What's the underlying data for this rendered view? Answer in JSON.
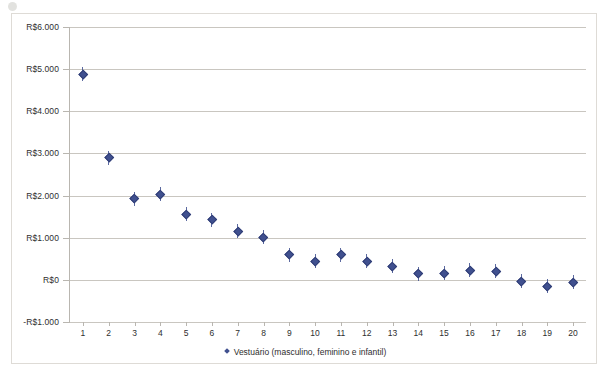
{
  "chart_data": {
    "type": "scatter",
    "title": "",
    "subtitle": "",
    "xlabel": "",
    "ylabel": "",
    "x": [
      1,
      2,
      3,
      4,
      5,
      6,
      7,
      8,
      9,
      10,
      11,
      12,
      13,
      14,
      15,
      16,
      17,
      18,
      19,
      20
    ],
    "values": [
      4880,
      2900,
      1930,
      2040,
      1570,
      1430,
      1150,
      1020,
      600,
      450,
      600,
      450,
      320,
      150,
      170,
      240,
      200,
      -20,
      -150,
      -50
    ],
    "series": [
      {
        "name": "Vestuário (masculino, feminino e infantil)",
        "values": [
          4880,
          2900,
          1930,
          2040,
          1570,
          1430,
          1150,
          1020,
          600,
          450,
          600,
          450,
          320,
          150,
          170,
          240,
          200,
          -20,
          -150,
          -50
        ]
      }
    ],
    "error_bars": true,
    "ylim": [
      -1000,
      6000
    ],
    "ytick_values": [
      6000,
      5000,
      4000,
      3000,
      2000,
      1000,
      0,
      -1000
    ],
    "ytick_labels": [
      "R$6.000",
      "R$5.000",
      "R$4.000",
      "R$3.000",
      "R$2.000",
      "R$1.000",
      "R$0",
      "-R$1.000"
    ],
    "xtick_labels": [
      "1",
      "2",
      "3",
      "4",
      "5",
      "6",
      "7",
      "8",
      "9",
      "10",
      "11",
      "12",
      "13",
      "14",
      "15",
      "16",
      "17",
      "18",
      "19",
      "20"
    ],
    "grid": true,
    "grid_axis": "y",
    "legend_position": "bottom",
    "legend_entries": [
      "Vestuário (masculino, feminino e infantil)"
    ],
    "marker_color": "#40508f",
    "gridline_color": "#c9c6c0",
    "background_color": "#ffffff",
    "border_color": "#dedbd6"
  },
  "legend": {
    "label": "Vestuário (masculino, feminino e infantil)"
  }
}
